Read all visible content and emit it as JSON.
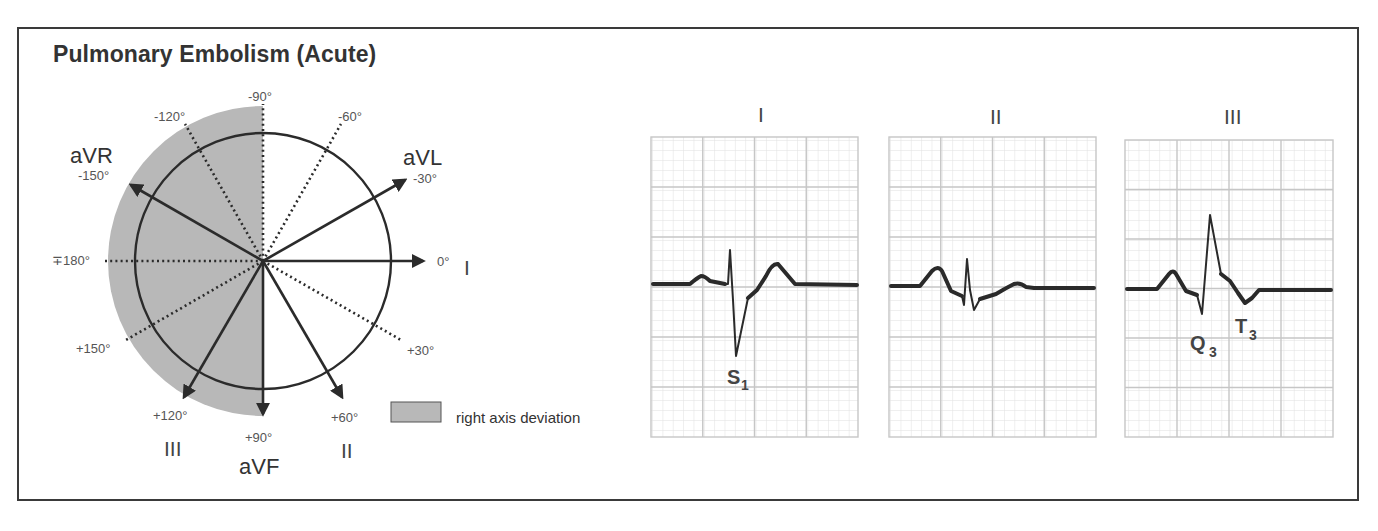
{
  "title": "Pulmonary Embolism (Acute)",
  "colors": {
    "frame": "#3a3a3a",
    "shade": "#b8b8b8",
    "grid_minor": "#e3e3e3",
    "grid_major": "#c8c8c8",
    "trace": "#2a2a2a",
    "text": "#333333"
  },
  "hexaxial": {
    "angle_labels": {
      "m90": "-90°",
      "m120": "-120°",
      "m60": "-60°",
      "m150": "-150°",
      "m30": "-30°",
      "p180": "∓180°",
      "zero": "0°",
      "p150": "+150°",
      "p30": "+30°",
      "p120": "+120°",
      "p90": "+90°",
      "p60": "+60°"
    },
    "lead_labels": {
      "aVR": "aVR",
      "aVL": "aVL",
      "I": "I",
      "III": "III",
      "aVF": "aVF",
      "II": "II"
    },
    "solid_leads_deg": [
      -150,
      -30,
      0,
      60,
      90,
      120
    ],
    "dotted_lines_deg": [
      -120,
      -90,
      -60,
      30,
      150,
      180
    ],
    "shaded_range_deg": [
      90,
      270
    ]
  },
  "legend": {
    "label": "right axis deviation"
  },
  "ecg_strips": [
    {
      "lead": "I",
      "annotations": [
        {
          "main": "S",
          "sub": "1"
        }
      ]
    },
    {
      "lead": "II",
      "annotations": []
    },
    {
      "lead": "III",
      "annotations": [
        {
          "main": "Q",
          "sub": "3"
        },
        {
          "main": "T",
          "sub": "3"
        }
      ]
    }
  ]
}
